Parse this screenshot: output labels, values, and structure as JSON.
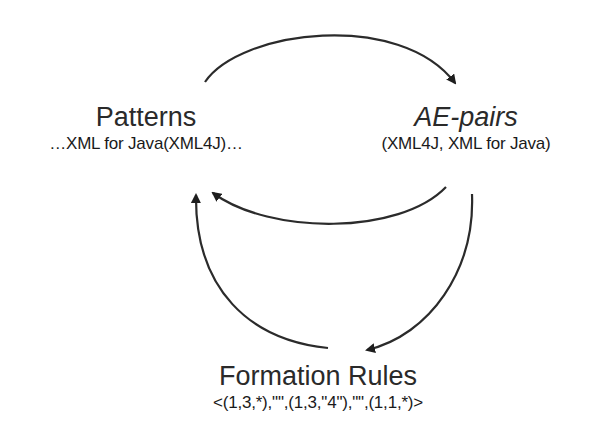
{
  "diagram": {
    "nodes": [
      {
        "id": "patterns",
        "title": "Patterns",
        "subtitle": "…XML for Java(XML4J)…"
      },
      {
        "id": "ae_pairs",
        "title": "AE-pairs",
        "subtitle": "(XML4J, XML for Java)"
      },
      {
        "id": "formation_rules",
        "title": "Formation Rules",
        "subtitle": "<(1,3,*),\"\",(1,3,\"4\"),\"\",(1,1,*)>"
      }
    ],
    "edges": [
      {
        "from": "patterns",
        "to": "ae_pairs"
      },
      {
        "from": "ae_pairs",
        "to": "patterns"
      },
      {
        "from": "ae_pairs",
        "to": "formation_rules"
      },
      {
        "from": "formation_rules",
        "to": "patterns"
      }
    ],
    "colors": {
      "stroke": "#2b2b2b",
      "text": "#222222",
      "background": "#ffffff"
    }
  }
}
